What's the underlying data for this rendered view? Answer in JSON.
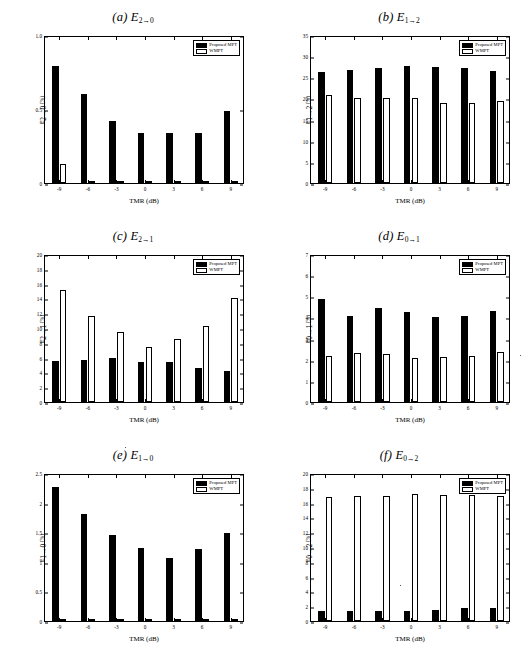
{
  "figure": {
    "panel_count": 6,
    "xlabel": "TMR (dB)",
    "categories": [
      "-9",
      "-6",
      "-3",
      "0",
      "3",
      "6",
      "9"
    ],
    "legend": {
      "series1": "Proposed MPT",
      "series2": "WMPT"
    },
    "colors": {
      "series1": "#000000",
      "series2": "#ffffff",
      "axis": "#000000",
      "background": "#ffffff"
    }
  },
  "panels": [
    {
      "id": "a",
      "tag": "(a)",
      "symbol": "E",
      "sub_from": "2",
      "sub_to": "0",
      "title_plain": "(a) E2→0",
      "ylabel_plain": "E2→0 (%)",
      "yticks": [
        "0",
        "0.5",
        "1.0"
      ],
      "chart_data": {
        "type": "bar",
        "title": "(a) E2→0",
        "xlabel": "TMR (dB)",
        "ylabel": "E2→0 (%)",
        "categories": [
          "-9",
          "-6",
          "-3",
          "0",
          "3",
          "6",
          "9"
        ],
        "ylim": [
          0,
          1.0
        ],
        "ytick_values": [
          0,
          0.5,
          1.0
        ],
        "grid": false,
        "legend_position": "top-right",
        "series": [
          {
            "name": "Proposed MPT",
            "values": [
              0.79,
              0.6,
              0.42,
              0.335,
              0.335,
              0.335,
              0.485
            ]
          },
          {
            "name": "WMPT",
            "values": [
              0.13,
              0.005,
              0.005,
              0.005,
              0.005,
              0.005,
              0.005
            ]
          }
        ]
      }
    },
    {
      "id": "b",
      "tag": "(b)",
      "symbol": "E",
      "sub_from": "1",
      "sub_to": "2",
      "title_plain": "(b) E1→2",
      "ylabel_plain": "E1→2 (%)",
      "yticks": [
        "0",
        "5",
        "10",
        "15",
        "20",
        "25",
        "30",
        "35"
      ],
      "chart_data": {
        "type": "bar",
        "title": "(b) E1→2",
        "xlabel": "TMR (dB)",
        "ylabel": "E1→2 (%)",
        "categories": [
          "-9",
          "-6",
          "-3",
          "0",
          "3",
          "6",
          "9"
        ],
        "ylim": [
          0,
          35
        ],
        "ytick_values": [
          0,
          5,
          10,
          15,
          20,
          25,
          30,
          35
        ],
        "grid": false,
        "legend_position": "top-right",
        "series": [
          {
            "name": "Proposed MPT",
            "values": [
              26.2,
              26.8,
              27.1,
              27.7,
              27.4,
              27.2,
              26.5
            ]
          },
          {
            "name": "WMPT",
            "values": [
              20.7,
              20.2,
              20.2,
              20.2,
              19.0,
              19.0,
              19.4
            ]
          }
        ]
      }
    },
    {
      "id": "c",
      "tag": "(c)",
      "symbol": "E",
      "sub_from": "2",
      "sub_to": "1",
      "title_plain": "(c) E2→1",
      "ylabel_plain": "E2→1 (%)",
      "yticks": [
        "0",
        "2",
        "4",
        "6",
        "8",
        "10",
        "12",
        "14",
        "16",
        "18",
        "20"
      ],
      "chart_data": {
        "type": "bar",
        "title": "(c) E2→1",
        "xlabel": "TMR (dB)",
        "ylabel": "E2→1 (%)",
        "categories": [
          "-9",
          "-6",
          "-3",
          "0",
          "3",
          "6",
          "9"
        ],
        "ylim": [
          0,
          20
        ],
        "ytick_values": [
          0,
          2,
          4,
          6,
          8,
          10,
          12,
          14,
          16,
          18,
          20
        ],
        "grid": false,
        "legend_position": "top-right",
        "series": [
          {
            "name": "Proposed MPT",
            "values": [
              5.6,
              5.7,
              6.0,
              5.4,
              5.45,
              4.65,
              4.2
            ]
          },
          {
            "name": "WMPT",
            "values": [
              15.2,
              11.65,
              9.4,
              7.5,
              8.55,
              10.3,
              14.1
            ]
          }
        ]
      }
    },
    {
      "id": "d",
      "tag": "(d)",
      "symbol": "E",
      "sub_from": "0",
      "sub_to": "1",
      "title_plain": "(d) E0→1",
      "ylabel_plain": "E0→1 (%)",
      "yticks": [
        "0",
        "1",
        "2",
        "3",
        "4",
        "5",
        "6",
        "7"
      ],
      "chart_data": {
        "type": "bar",
        "title": "(d) E0→1",
        "xlabel": "TMR (dB)",
        "ylabel": "E0→1 (%)",
        "categories": [
          "-9",
          "-6",
          "-3",
          "0",
          "3",
          "6",
          "9"
        ],
        "ylim": [
          0,
          7
        ],
        "ytick_values": [
          0,
          1,
          2,
          3,
          4,
          5,
          6,
          7
        ],
        "grid": false,
        "legend_position": "top-right",
        "series": [
          {
            "name": "Proposed MPT",
            "values": [
              4.87,
              4.08,
              4.45,
              4.28,
              4.03,
              4.08,
              4.32
            ]
          },
          {
            "name": "WMPT",
            "values": [
              2.17,
              2.3,
              2.25,
              2.07,
              2.12,
              2.2,
              2.37
            ]
          }
        ]
      }
    },
    {
      "id": "e",
      "tag": "(e)",
      "symbol": "E",
      "sub_from": "1",
      "sub_to": "0",
      "title_plain": "(e) E1→0",
      "ylabel_plain": "E1→0 (%)",
      "yticks": [
        "0",
        "0.5",
        "1",
        "1.5",
        "2",
        "2.5"
      ],
      "chart_data": {
        "type": "bar",
        "title": "(e) E1→0",
        "xlabel": "TMR (dB)",
        "ylabel": "E1→0 (%)",
        "categories": [
          "-9",
          "-6",
          "-3",
          "0",
          "3",
          "6",
          "9"
        ],
        "ylim": [
          0,
          2.5
        ],
        "ytick_values": [
          0,
          0.5,
          1,
          1.5,
          2,
          2.5
        ],
        "grid": false,
        "legend_position": "top-right",
        "series": [
          {
            "name": "Proposed MPT",
            "values": [
              2.27,
              1.81,
              1.45,
              1.24,
              1.07,
              1.21,
              1.49
            ]
          },
          {
            "name": "WMPT",
            "values": [
              0.04,
              0.04,
              0.04,
              0.04,
              0.04,
              0.04,
              0.04
            ]
          }
        ]
      }
    },
    {
      "id": "f",
      "tag": "(f)",
      "symbol": "E",
      "sub_from": "0",
      "sub_to": "2",
      "title_plain": "(f) E0→2",
      "ylabel_plain": "E0→2 (%)",
      "yticks": [
        "0",
        "2",
        "4",
        "6",
        "8",
        "10",
        "12",
        "14",
        "16",
        "18",
        "20"
      ],
      "chart_data": {
        "type": "bar",
        "title": "(f) E0→2",
        "xlabel": "TMR (dB)",
        "ylabel": "E0→2 (%)",
        "categories": [
          "-9",
          "-6",
          "-3",
          "0",
          "3",
          "6",
          "9"
        ],
        "ylim": [
          0,
          20
        ],
        "ytick_values": [
          0,
          2,
          4,
          6,
          8,
          10,
          12,
          14,
          16,
          18,
          20
        ],
        "grid": false,
        "legend_position": "top-right",
        "series": [
          {
            "name": "Proposed MPT",
            "values": [
              1.3,
              1.3,
              1.3,
              1.4,
              1.5,
              1.75,
              1.75
            ]
          },
          {
            "name": "WMPT",
            "values": [
              16.8,
              16.85,
              16.85,
              17.1,
              17.05,
              17.05,
              16.9
            ]
          }
        ]
      }
    }
  ]
}
